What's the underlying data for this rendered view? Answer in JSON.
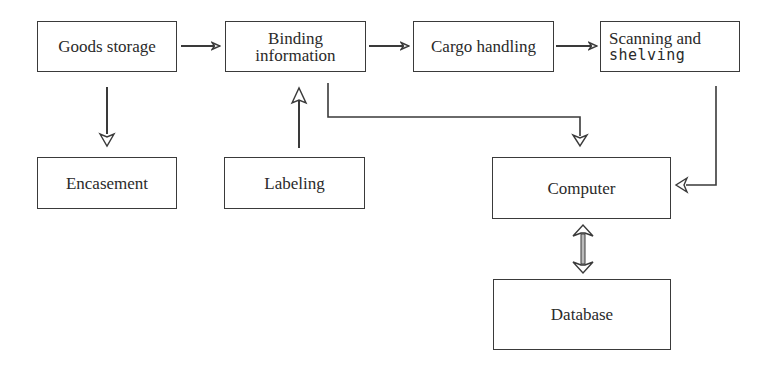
{
  "diagram": {
    "type": "flowchart",
    "nodes": {
      "goods_storage": {
        "label": "Goods storage"
      },
      "binding_information": {
        "line1": "Binding",
        "line2": "information"
      },
      "cargo_handling": {
        "label": "Cargo handling"
      },
      "scanning_shelving": {
        "line1": "Scanning and",
        "line2": "shelving"
      },
      "encasement": {
        "label": "Encasement"
      },
      "labeling": {
        "label": "Labeling"
      },
      "computer": {
        "label": "Computer"
      },
      "database": {
        "label": "Database"
      }
    },
    "edges": [
      {
        "from": "Goods storage",
        "to": "Binding information",
        "style": "arrow"
      },
      {
        "from": "Binding information",
        "to": "Cargo handling",
        "style": "arrow"
      },
      {
        "from": "Cargo handling",
        "to": "Scanning and shelving",
        "style": "arrow"
      },
      {
        "from": "Goods storage",
        "to": "Encasement",
        "style": "hollow-arrow"
      },
      {
        "from": "Labeling",
        "to": "Binding information",
        "style": "hollow-arrow"
      },
      {
        "from": "Binding information",
        "to": "Computer",
        "style": "elbow-arrow"
      },
      {
        "from": "Scanning and shelving",
        "to": "Computer",
        "style": "elbow-arrow"
      },
      {
        "from": "Computer",
        "to": "Database",
        "style": "bidirectional-arrow"
      }
    ],
    "colors": {
      "line": "#3a3a3a",
      "background": "#ffffff",
      "text": "#2a2a2a"
    }
  }
}
